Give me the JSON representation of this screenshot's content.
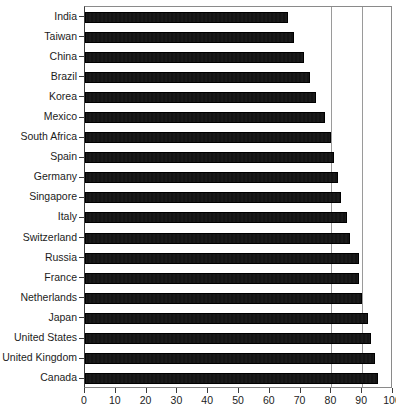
{
  "chart_data": {
    "type": "bar",
    "orientation": "horizontal",
    "title": "",
    "xlabel": "",
    "ylabel": "",
    "xlim": [
      0,
      100
    ],
    "xticks": [
      0,
      10,
      20,
      30,
      40,
      50,
      60,
      70,
      80,
      90,
      100
    ],
    "gridlines": [
      80,
      90
    ],
    "grid": true,
    "legend": "none",
    "bar_color": "#111111",
    "categories": [
      "India",
      "Taiwan",
      "China",
      "Brazil",
      "Korea",
      "Mexico",
      "South Africa",
      "Spain",
      "Germany",
      "Singapore",
      "Italy",
      "Switzerland",
      "Russia",
      "France",
      "Netherlands",
      "Japan",
      "United States",
      "United Kingdom",
      "Canada"
    ],
    "values": [
      66,
      68,
      71,
      73,
      75,
      78,
      80,
      81,
      82,
      83,
      85,
      86,
      89,
      89,
      90,
      92,
      93,
      94,
      95
    ]
  },
  "axis": {
    "x_tick_labels": [
      "0",
      "10",
      "20",
      "30",
      "40",
      "50",
      "60",
      "70",
      "80",
      "90",
      "100"
    ]
  }
}
